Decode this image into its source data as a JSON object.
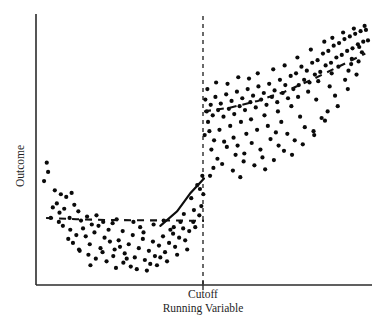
{
  "chart_data": {
    "type": "scatter",
    "title": "",
    "xlabel": "Running Variable",
    "ylabel": "Outcome",
    "grid": false,
    "legend": null,
    "xlim": [
      0,
      100
    ],
    "ylim": [
      0,
      100
    ],
    "axis_ticks_shown": false,
    "annotations": [
      {
        "name": "cutoff-tick-label",
        "text": "Cutoff",
        "x": 50,
        "axis": "x"
      }
    ],
    "cutoff": {
      "x": 50,
      "style": "dashed-vertical",
      "label": "Cutoff",
      "jump_direction": "up",
      "jump_size": 26
    },
    "fits": [
      {
        "name": "left-global-dashed-fit",
        "style": "dashed",
        "side": "left",
        "points": [
          [
            3,
            25.5
          ],
          [
            12,
            25.0
          ],
          [
            22,
            24.7
          ],
          [
            32,
            24.6
          ],
          [
            42,
            24.5
          ],
          [
            50,
            24.4
          ]
        ]
      },
      {
        "name": "left-local-solid-fit",
        "style": "solid",
        "side": "left",
        "points": [
          [
            37,
            22.5
          ],
          [
            42,
            28.0
          ],
          [
            46,
            35.0
          ],
          [
            50,
            40.5
          ]
        ]
      },
      {
        "name": "right-global-dashed-fit",
        "style": "dashed",
        "side": "right",
        "points": [
          [
            50,
            66.0
          ],
          [
            58,
            67.5
          ],
          [
            66,
            70.0
          ],
          [
            74,
            73.5
          ],
          [
            82,
            78.0
          ],
          [
            90,
            83.0
          ],
          [
            98,
            88.0
          ]
        ]
      }
    ],
    "series": [
      {
        "name": "left-of-cutoff",
        "color": "#0a0a0a",
        "marker": "filled-circle",
        "points": [
          [
            3.2,
            46.5
          ],
          [
            3.6,
            43.0
          ],
          [
            2.4,
            39.5
          ],
          [
            5.6,
            36.0
          ],
          [
            7.4,
            34.5
          ],
          [
            6.2,
            31.0
          ],
          [
            9.0,
            33.5
          ],
          [
            10.6,
            35.0
          ],
          [
            8.4,
            29.0
          ],
          [
            11.4,
            30.5
          ],
          [
            12.6,
            28.0
          ],
          [
            4.4,
            25.5
          ],
          [
            6.8,
            24.0
          ],
          [
            8.0,
            22.5
          ],
          [
            10.2,
            21.0
          ],
          [
            13.4,
            24.5
          ],
          [
            15.2,
            26.0
          ],
          [
            14.0,
            21.5
          ],
          [
            16.6,
            23.0
          ],
          [
            12.0,
            19.0
          ],
          [
            9.6,
            17.5
          ],
          [
            11.0,
            16.0
          ],
          [
            14.8,
            18.5
          ],
          [
            17.4,
            20.0
          ],
          [
            18.6,
            22.5
          ],
          [
            16.0,
            15.5
          ],
          [
            13.0,
            13.0
          ],
          [
            15.6,
            11.5
          ],
          [
            19.2,
            14.0
          ],
          [
            20.4,
            18.0
          ],
          [
            21.6,
            21.0
          ],
          [
            22.8,
            23.5
          ],
          [
            19.8,
            12.5
          ],
          [
            17.8,
            10.0
          ],
          [
            21.0,
            9.0
          ],
          [
            23.4,
            13.5
          ],
          [
            24.6,
            17.0
          ],
          [
            25.8,
            20.5
          ],
          [
            23.0,
            11.0
          ],
          [
            26.4,
            12.0
          ],
          [
            27.6,
            15.5
          ],
          [
            28.8,
            19.0
          ],
          [
            26.0,
            8.5
          ],
          [
            29.4,
            10.5
          ],
          [
            30.6,
            14.0
          ],
          [
            31.8,
            17.5
          ],
          [
            28.2,
            7.0
          ],
          [
            32.4,
            9.5
          ],
          [
            33.6,
            13.0
          ],
          [
            34.8,
            16.5
          ],
          [
            30.0,
            6.0
          ],
          [
            35.4,
            11.0
          ],
          [
            36.6,
            15.0
          ],
          [
            37.8,
            18.5
          ],
          [
            33.0,
            5.5
          ],
          [
            38.4,
            12.5
          ],
          [
            39.6,
            16.0
          ],
          [
            40.8,
            19.5
          ],
          [
            36.0,
            7.5
          ],
          [
            41.4,
            14.5
          ],
          [
            42.6,
            18.0
          ],
          [
            43.8,
            21.5
          ],
          [
            39.0,
            9.0
          ],
          [
            44.4,
            17.0
          ],
          [
            45.6,
            20.5
          ],
          [
            46.8,
            24.0
          ],
          [
            42.0,
            11.5
          ],
          [
            47.4,
            22.0
          ],
          [
            48.6,
            26.5
          ],
          [
            49.2,
            30.0
          ],
          [
            45.0,
            13.5
          ],
          [
            49.8,
            34.5
          ],
          [
            48.0,
            38.0
          ],
          [
            46.2,
            33.0
          ],
          [
            44.0,
            27.0
          ],
          [
            41.0,
            22.0
          ],
          [
            38.0,
            24.5
          ],
          [
            35.0,
            23.0
          ],
          [
            31.0,
            22.0
          ],
          [
            24.0,
            25.0
          ],
          [
            20.0,
            24.0
          ],
          [
            18.0,
            26.5
          ],
          [
            7.0,
            27.5
          ],
          [
            5.0,
            29.5
          ],
          [
            10.0,
            25.5
          ],
          [
            22.0,
            16.5
          ],
          [
            25.0,
            14.5
          ],
          [
            27.0,
            10.0
          ],
          [
            34.0,
            8.0
          ],
          [
            43.0,
            24.0
          ],
          [
            47.0,
            28.5
          ],
          [
            49.5,
            41.5
          ],
          [
            48.8,
            36.5
          ],
          [
            32.0,
            20.0
          ],
          [
            29.0,
            24.0
          ],
          [
            40.0,
            21.0
          ],
          [
            37.0,
            10.5
          ],
          [
            12.8,
            13.5
          ],
          [
            16.2,
            7.5
          ],
          [
            23.8,
            6.5
          ]
        ]
      },
      {
        "name": "right-of-cutoff",
        "color": "#0a0a0a",
        "marker": "filled-circle",
        "points": [
          [
            50.4,
            70.5
          ],
          [
            50.8,
            66.0
          ],
          [
            51.2,
            62.0
          ],
          [
            52.0,
            68.5
          ],
          [
            52.6,
            64.5
          ],
          [
            53.4,
            71.5
          ],
          [
            54.2,
            66.5
          ],
          [
            51.6,
            58.5
          ],
          [
            53.0,
            55.0
          ],
          [
            55.0,
            69.0
          ],
          [
            55.8,
            64.0
          ],
          [
            56.6,
            72.5
          ],
          [
            57.4,
            67.0
          ],
          [
            54.6,
            59.0
          ],
          [
            56.0,
            54.5
          ],
          [
            58.2,
            70.0
          ],
          [
            59.0,
            65.0
          ],
          [
            59.8,
            73.5
          ],
          [
            60.6,
            68.0
          ],
          [
            57.8,
            60.5
          ],
          [
            58.8,
            56.0
          ],
          [
            61.4,
            71.0
          ],
          [
            62.2,
            66.5
          ],
          [
            63.0,
            74.5
          ],
          [
            63.8,
            69.5
          ],
          [
            61.0,
            62.0
          ],
          [
            62.6,
            57.5
          ],
          [
            64.6,
            72.0
          ],
          [
            65.4,
            67.5
          ],
          [
            66.2,
            75.5
          ],
          [
            67.0,
            70.5
          ],
          [
            64.0,
            63.0
          ],
          [
            65.8,
            59.0
          ],
          [
            67.8,
            73.0
          ],
          [
            68.6,
            68.5
          ],
          [
            69.4,
            76.5
          ],
          [
            70.2,
            71.5
          ],
          [
            68.0,
            64.5
          ],
          [
            69.0,
            60.5
          ],
          [
            71.0,
            74.0
          ],
          [
            71.8,
            69.5
          ],
          [
            72.6,
            78.0
          ],
          [
            73.4,
            73.0
          ],
          [
            72.0,
            66.0
          ],
          [
            73.0,
            62.0
          ],
          [
            74.2,
            76.0
          ],
          [
            75.0,
            71.0
          ],
          [
            75.8,
            79.5
          ],
          [
            76.6,
            74.5
          ],
          [
            76.0,
            68.0
          ],
          [
            77.4,
            80.5
          ],
          [
            78.2,
            76.0
          ],
          [
            79.0,
            83.0
          ],
          [
            79.8,
            78.0
          ],
          [
            78.0,
            71.5
          ],
          [
            80.6,
            81.5
          ],
          [
            81.4,
            77.0
          ],
          [
            82.2,
            84.5
          ],
          [
            83.0,
            80.0
          ],
          [
            81.0,
            73.5
          ],
          [
            83.8,
            85.5
          ],
          [
            84.6,
            81.0
          ],
          [
            85.4,
            88.0
          ],
          [
            86.2,
            83.5
          ],
          [
            84.0,
            77.5
          ],
          [
            87.0,
            89.0
          ],
          [
            87.8,
            84.5
          ],
          [
            88.6,
            91.0
          ],
          [
            89.4,
            86.5
          ],
          [
            88.0,
            80.5
          ],
          [
            90.2,
            92.0
          ],
          [
            91.0,
            87.5
          ],
          [
            91.8,
            93.5
          ],
          [
            92.6,
            89.0
          ],
          [
            90.0,
            83.0
          ],
          [
            93.4,
            94.5
          ],
          [
            94.2,
            90.0
          ],
          [
            95.0,
            95.5
          ],
          [
            95.8,
            91.5
          ],
          [
            94.0,
            86.0
          ],
          [
            96.6,
            96.5
          ],
          [
            97.4,
            92.5
          ],
          [
            98.2,
            97.0
          ],
          [
            98.8,
            93.0
          ],
          [
            97.0,
            88.5
          ],
          [
            52.2,
            51.5
          ],
          [
            54.0,
            48.0
          ],
          [
            56.8,
            52.5
          ],
          [
            59.4,
            49.5
          ],
          [
            60.0,
            53.0
          ],
          [
            62.0,
            50.0
          ],
          [
            64.2,
            54.0
          ],
          [
            66.8,
            51.5
          ],
          [
            69.8,
            55.5
          ],
          [
            72.2,
            53.0
          ],
          [
            74.8,
            57.5
          ],
          [
            77.0,
            55.0
          ],
          [
            80.0,
            60.0
          ],
          [
            82.6,
            58.5
          ],
          [
            85.0,
            63.5
          ],
          [
            86.8,
            66.0
          ],
          [
            89.0,
            72.0
          ],
          [
            92.0,
            78.0
          ],
          [
            93.0,
            81.5
          ],
          [
            96.0,
            85.0
          ],
          [
            51.0,
            74.5
          ],
          [
            53.6,
            77.0
          ],
          [
            57.0,
            76.5
          ],
          [
            60.2,
            79.0
          ],
          [
            63.4,
            78.5
          ],
          [
            66.0,
            80.5
          ],
          [
            70.6,
            82.0
          ],
          [
            74.0,
            83.5
          ],
          [
            77.8,
            86.5
          ],
          [
            81.8,
            89.5
          ],
          [
            85.8,
            92.5
          ],
          [
            88.2,
            94.0
          ],
          [
            91.4,
            96.0
          ],
          [
            94.6,
            97.5
          ],
          [
            97.8,
            98.5
          ],
          [
            52.8,
            44.5
          ],
          [
            55.4,
            46.0
          ],
          [
            58.6,
            43.5
          ],
          [
            61.8,
            47.0
          ],
          [
            65.0,
            45.5
          ],
          [
            67.4,
            48.5
          ],
          [
            70.8,
            47.5
          ],
          [
            73.8,
            51.0
          ],
          [
            76.2,
            49.5
          ],
          [
            79.4,
            53.5
          ],
          [
            82.8,
            57.0
          ],
          [
            86.0,
            62.5
          ],
          [
            89.8,
            68.0
          ],
          [
            92.8,
            74.5
          ],
          [
            95.4,
            80.0
          ],
          [
            50.2,
            57.0
          ],
          [
            51.8,
            41.5
          ],
          [
            60.8,
            41.0
          ],
          [
            68.2,
            44.0
          ],
          [
            71.4,
            58.0
          ],
          [
            78.6,
            64.0
          ],
          [
            83.4,
            70.5
          ],
          [
            87.4,
            75.5
          ],
          [
            93.8,
            84.0
          ],
          [
            96.2,
            90.5
          ]
        ]
      }
    ]
  },
  "axis": {
    "y_label": "Outcome",
    "x_label": "Running Variable",
    "cutoff_label": "Cutoff"
  }
}
